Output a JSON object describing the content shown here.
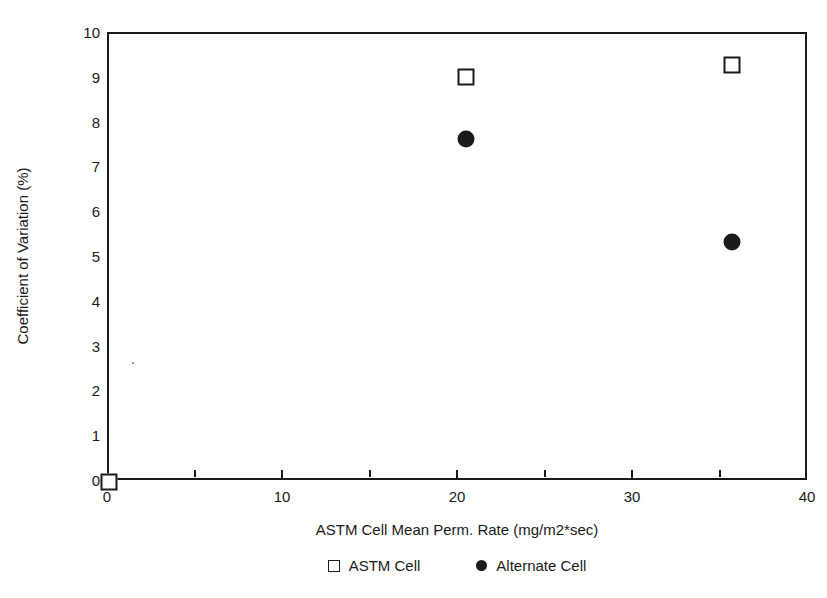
{
  "chart_data": {
    "type": "scatter",
    "title": "",
    "xlabel": "ASTM Cell Mean Perm. Rate (mg/m2*sec)",
    "ylabel": "Coefficient of Variation (%)",
    "xlim": [
      0,
      40
    ],
    "ylim": [
      0,
      10
    ],
    "x_ticks": [
      0,
      10,
      20,
      30,
      40
    ],
    "x_tick_labels": [
      "0",
      "10",
      "20",
      "30",
      "40"
    ],
    "x_minor_ticks": [
      5,
      15,
      25,
      35
    ],
    "y_ticks": [
      0,
      1,
      2,
      3,
      4,
      5,
      6,
      7,
      8,
      9,
      10
    ],
    "y_tick_labels": [
      "0",
      "1",
      "2",
      "3",
      "4",
      "5",
      "6",
      "7",
      "8",
      "9",
      "10"
    ],
    "grid": false,
    "legend_position": "below-axis",
    "series": [
      {
        "name": "ASTM Cell",
        "marker": "open-square",
        "color": "#1a1a1a",
        "points": [
          {
            "x": 0.0,
            "y": 0.0
          },
          {
            "x": 20.4,
            "y": 9.05
          },
          {
            "x": 35.6,
            "y": 9.3
          }
        ]
      },
      {
        "name": "Alternate Cell",
        "marker": "filled-circle",
        "color": "#1a1a1a",
        "points": [
          {
            "x": 20.4,
            "y": 7.65
          },
          {
            "x": 35.6,
            "y": 5.35
          }
        ]
      }
    ]
  },
  "legend": {
    "items": [
      {
        "label": "ASTM Cell",
        "marker": "open-square"
      },
      {
        "label": "Alternate Cell",
        "marker": "filled-circle"
      }
    ]
  },
  "colors": {
    "ink": "#1a1a1a",
    "background": "#ffffff"
  }
}
